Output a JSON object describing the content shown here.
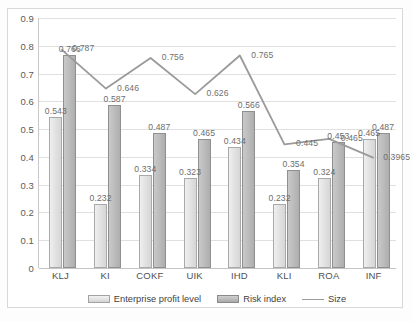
{
  "chart_data": {
    "type": "bar",
    "title": "",
    "xlabel": "",
    "ylabel": "",
    "ylim": [
      0,
      0.9
    ],
    "grid": true,
    "legend_position": "bottom",
    "categories": [
      "KLJ",
      "KI",
      "COKF",
      "UIK",
      "IHD",
      "KLI",
      "ROA",
      "INF"
    ],
    "ytick_labels": [
      "0.9",
      "0.8",
      "0.7",
      "0.6",
      "0.5",
      "0.4",
      "0.3",
      "0.2",
      "0.1",
      "0"
    ],
    "ytick_values": [
      0.9,
      0.8,
      0.7,
      0.6,
      0.5,
      0.4,
      0.3,
      0.2,
      0.1,
      0
    ],
    "series": [
      {
        "name": "Enterprise profit level",
        "type": "bar",
        "color": "#e3e3e3",
        "values": [
          0.543,
          0.232,
          0.334,
          0.323,
          0.434,
          0.232,
          0.324,
          0.465
        ],
        "labels": [
          "0.543",
          "0.232",
          "0.334",
          "0.323",
          "0.434",
          "0.232",
          "0.324",
          "0.465"
        ]
      },
      {
        "name": "Risk index",
        "type": "bar",
        "color": "#bdbdbd",
        "values": [
          0.766,
          0.587,
          0.487,
          0.465,
          0.566,
          0.354,
          0.453,
          0.487
        ],
        "labels": [
          "0.766",
          "0.587",
          "0.487",
          "0.465",
          "0.566",
          "0.354",
          "0.453",
          "0.487"
        ]
      },
      {
        "name": "Size",
        "type": "line",
        "color": "#9a9a9a",
        "values": [
          0.787,
          0.646,
          0.756,
          0.626,
          0.765,
          0.445,
          0.465,
          0.3965
        ],
        "labels": [
          "0.787",
          "0.646",
          "0.756",
          "0.626",
          "0.765",
          "0.445",
          "0.465",
          "0.3965"
        ]
      }
    ]
  },
  "legend": {
    "items": [
      {
        "label": "Enterprise profit level"
      },
      {
        "label": "Risk index"
      },
      {
        "label": "Size"
      }
    ]
  }
}
